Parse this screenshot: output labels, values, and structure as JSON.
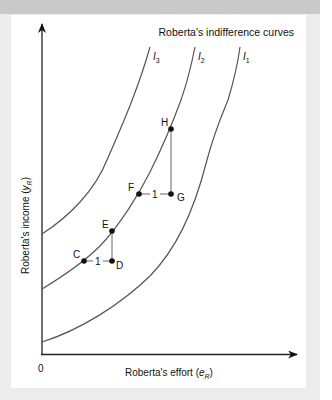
{
  "figure": {
    "title": "Roberta's indifference curves",
    "x_axis_label": "Roberta's effort (",
    "x_axis_var": "e",
    "x_axis_sub": "R",
    "x_axis_close": ")",
    "y_axis_label": "Roberta's income (",
    "y_axis_var": "y",
    "y_axis_sub": "R",
    "y_axis_close": ")",
    "origin_label": "0",
    "curves": [
      {
        "name": "I",
        "sub": "3"
      },
      {
        "name": "I",
        "sub": "2"
      },
      {
        "name": "I",
        "sub": "1"
      }
    ],
    "points": {
      "C": "C",
      "D": "D",
      "E": "E",
      "F": "F",
      "G": "G",
      "H": "H"
    },
    "step_labels": {
      "CD": "1",
      "FG": "1"
    },
    "colors": {
      "curve": "#555555",
      "axis": "#222222",
      "point": "#111111"
    }
  }
}
